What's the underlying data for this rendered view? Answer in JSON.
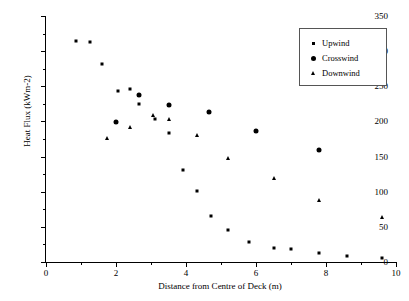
{
  "chart_data": {
    "type": "scatter",
    "title": "",
    "xlabel": "Distance from Centre of Deck (m)",
    "ylabel": "Heat Flux (kWm-2)",
    "xlim": [
      0,
      10
    ],
    "ylim": [
      0,
      350
    ],
    "xticks": [
      0,
      2,
      4,
      6,
      8,
      10
    ],
    "yticks": [
      0,
      50,
      100,
      150,
      200,
      250,
      300,
      350
    ],
    "xtick_labels": [
      "0",
      "2",
      "4",
      "6",
      "8",
      "10"
    ],
    "ytick_labels": [
      "0",
      "50",
      "100",
      "150",
      "200",
      "250",
      "300",
      "350"
    ],
    "x_minor_step": 1,
    "y_minor_step": 25,
    "grid": false,
    "legend_position": "top-right",
    "series": [
      {
        "name": "Upwind",
        "marker": "x",
        "color": "#000000",
        "points": [
          [
            0.85,
            315
          ],
          [
            1.25,
            313
          ],
          [
            1.6,
            281
          ],
          [
            2.05,
            243
          ],
          [
            2.4,
            246
          ],
          [
            2.65,
            225
          ],
          [
            3.1,
            203
          ],
          [
            3.5,
            184
          ],
          [
            3.9,
            131
          ],
          [
            4.3,
            101
          ],
          [
            4.7,
            66
          ],
          [
            5.2,
            46
          ],
          [
            5.8,
            28
          ],
          [
            6.5,
            20
          ],
          [
            7.0,
            18
          ],
          [
            7.8,
            13
          ],
          [
            8.6,
            8
          ],
          [
            9.6,
            6
          ]
        ]
      },
      {
        "name": "Crosswind",
        "marker": "circle",
        "color": "#000000",
        "points": [
          [
            2.0,
            199
          ],
          [
            2.65,
            238
          ],
          [
            3.5,
            223
          ],
          [
            4.65,
            214
          ],
          [
            6.0,
            187
          ],
          [
            7.8,
            160
          ]
        ]
      },
      {
        "name": "Downwind",
        "marker": "triangle",
        "color": "#000000",
        "points": [
          [
            1.75,
            176
          ],
          [
            2.4,
            192
          ],
          [
            3.05,
            209
          ],
          [
            3.5,
            204
          ],
          [
            4.3,
            180
          ],
          [
            5.2,
            148
          ],
          [
            6.5,
            120
          ],
          [
            7.8,
            88
          ],
          [
            9.6,
            64
          ]
        ]
      }
    ]
  },
  "legend": {
    "items": [
      {
        "label": "Upwind",
        "marker": "upwind-marker-icon"
      },
      {
        "label": "Crosswind",
        "marker": "crosswind-marker-icon"
      },
      {
        "label": "Downwind",
        "marker": "downwind-marker-icon"
      }
    ]
  }
}
